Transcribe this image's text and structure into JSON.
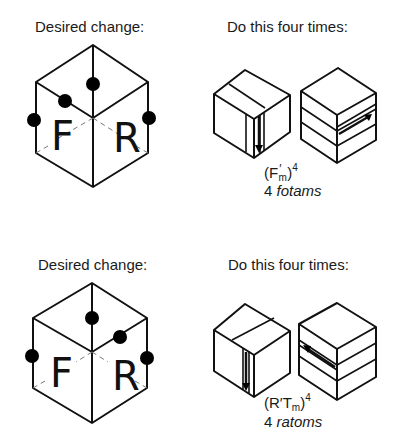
{
  "sections": [
    {
      "desired_label": "Desired change:",
      "action_label": "Do this four times:",
      "face_letters": [
        "F",
        "R"
      ],
      "formula": {
        "open": "(F",
        "T": "T",
        "prime": "′",
        "sub": "m",
        "close": ")",
        "exp": "4"
      },
      "caption_count": "4",
      "caption_word": "fotams"
    },
    {
      "desired_label": "Desired change:",
      "action_label": "Do this four times:",
      "face_letters": [
        "F",
        "R"
      ],
      "formula": {
        "open": "(R′",
        "T": "T",
        "sub": "m",
        "close": ")",
        "exp": "4"
      },
      "caption_count": "4",
      "caption_word": "ratoms"
    }
  ]
}
